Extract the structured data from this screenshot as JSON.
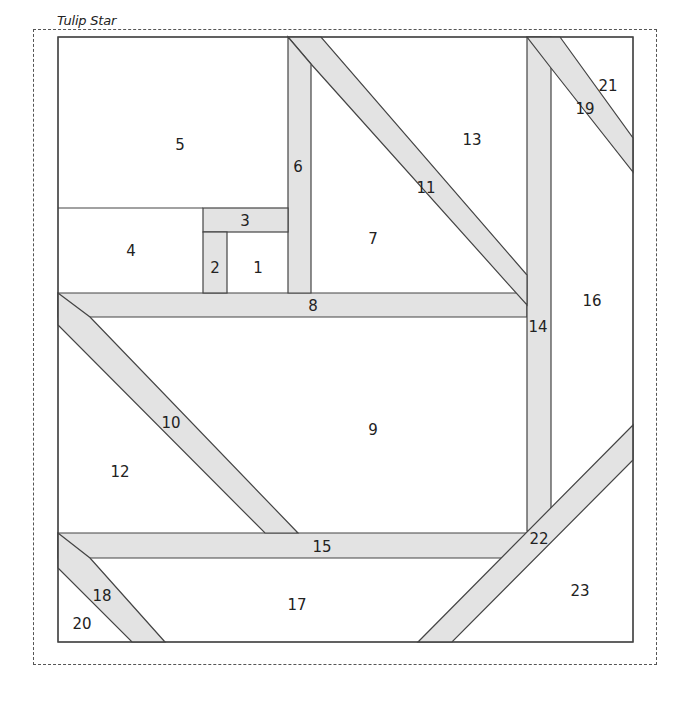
{
  "title": "Tulip Star",
  "colors": {
    "strip_fill": "#e3e3e3",
    "background_fill": "#ffffff",
    "outline": "#444444",
    "dashed_border": "#555555"
  },
  "pieces": [
    {
      "id": "1",
      "label": "1",
      "x": 258,
      "y": 268
    },
    {
      "id": "2",
      "label": "2",
      "x": 215,
      "y": 268
    },
    {
      "id": "3",
      "label": "3",
      "x": 245,
      "y": 221
    },
    {
      "id": "4",
      "label": "4",
      "x": 131,
      "y": 251
    },
    {
      "id": "5",
      "label": "5",
      "x": 180,
      "y": 145
    },
    {
      "id": "6",
      "label": "6",
      "x": 298,
      "y": 167
    },
    {
      "id": "7",
      "label": "7",
      "x": 373,
      "y": 239
    },
    {
      "id": "8",
      "label": "8",
      "x": 313,
      "y": 306
    },
    {
      "id": "9",
      "label": "9",
      "x": 373,
      "y": 430
    },
    {
      "id": "10",
      "label": "10",
      "x": 171,
      "y": 423
    },
    {
      "id": "11",
      "label": "11",
      "x": 426,
      "y": 188
    },
    {
      "id": "12",
      "label": "12",
      "x": 120,
      "y": 472
    },
    {
      "id": "13",
      "label": "13",
      "x": 472,
      "y": 140
    },
    {
      "id": "14",
      "label": "14",
      "x": 538,
      "y": 327
    },
    {
      "id": "15",
      "label": "15",
      "x": 322,
      "y": 547
    },
    {
      "id": "16",
      "label": "16",
      "x": 592,
      "y": 301
    },
    {
      "id": "17",
      "label": "17",
      "x": 297,
      "y": 605
    },
    {
      "id": "18",
      "label": "18",
      "x": 102,
      "y": 596
    },
    {
      "id": "19",
      "label": "19",
      "x": 585,
      "y": 109
    },
    {
      "id": "20",
      "label": "20",
      "x": 82,
      "y": 624
    },
    {
      "id": "21",
      "label": "21",
      "x": 608,
      "y": 86
    },
    {
      "id": "22",
      "label": "22",
      "x": 539,
      "y": 539
    },
    {
      "id": "23",
      "label": "23",
      "x": 580,
      "y": 591
    }
  ]
}
